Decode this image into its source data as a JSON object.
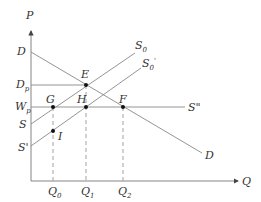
{
  "diagram": {
    "type": "supply-demand",
    "axes": {
      "y_label": "P",
      "x_label": "Q"
    },
    "price_labels": {
      "demand_intercept": "D",
      "dp": {
        "main": "D",
        "sub": "p"
      },
      "wp": {
        "main": "W",
        "sub": "p"
      },
      "s_intercept": "S",
      "s_prime_intercept": "S'"
    },
    "curves": {
      "s0": {
        "main": "S",
        "sub": "0"
      },
      "s0_prime": {
        "main": "S",
        "sub": "0",
        "sup": "'"
      },
      "s_double_prime": "S\"",
      "demand": "D"
    },
    "points": {
      "E": "E",
      "G": "G",
      "H": "H",
      "F": "F",
      "I": "I"
    },
    "quantities": {
      "q0": {
        "main": "Q",
        "sub": "0"
      },
      "q1": {
        "main": "Q",
        "sub": "1"
      },
      "q2": {
        "main": "Q",
        "sub": "2"
      }
    }
  }
}
